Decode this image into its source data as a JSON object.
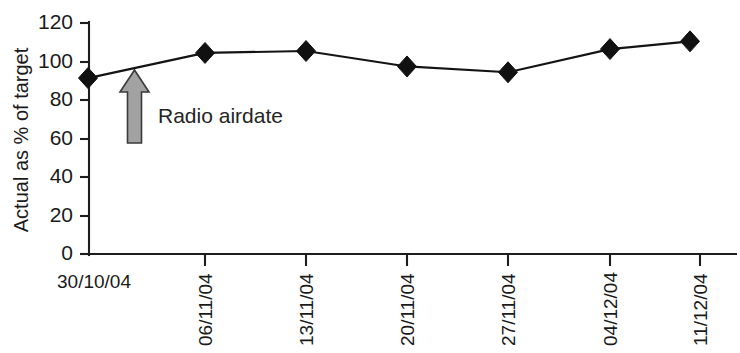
{
  "chart_data": {
    "type": "line",
    "title": "",
    "subtitle": "",
    "xlabel": "",
    "ylabel": "Actual as % of target",
    "categories": [
      "30/10/04",
      "06/11/04",
      "13/11/04",
      "20/11/04",
      "27/11/04",
      "04/12/04",
      "11/12/04"
    ],
    "values": [
      91,
      104,
      105,
      97,
      94,
      106,
      110
    ],
    "series": [
      {
        "name": "Actual as % of target",
        "values": [
          91,
          104,
          105,
          97,
          94,
          106,
          110
        ]
      }
    ],
    "ylim": [
      0,
      120
    ],
    "ytick_labels": [
      "0",
      "20",
      "40",
      "60",
      "80",
      "100",
      "120"
    ],
    "ytick_values": [
      0,
      20,
      40,
      60,
      80,
      100,
      120
    ],
    "grid": false,
    "legend": "none",
    "marker": "diamond",
    "line_color": "#141414",
    "marker_color": "#111111",
    "annotations": [
      {
        "label": "Radio airdate",
        "type": "up-arrow",
        "color": "#a2a2a2",
        "outline_color": "#3a3a3a",
        "points_at_category": "30/10/04"
      }
    ]
  },
  "axes": {
    "y_title": "Actual as % of target",
    "y_ticks": [
      "0",
      "20",
      "40",
      "60",
      "80",
      "100",
      "120"
    ],
    "x_ticks": [
      "30/10/04",
      "06/11/04",
      "13/11/04",
      "20/11/04",
      "27/11/04",
      "04/12/04",
      "11/12/04"
    ]
  },
  "annotation": {
    "label": "Radio airdate"
  },
  "footer": {
    "ghost_text": ""
  }
}
